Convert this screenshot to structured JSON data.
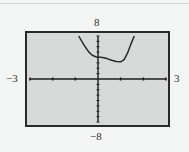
{
  "chart_data": {
    "type": "line",
    "title": "",
    "xlabel": "",
    "ylabel": "",
    "xlim": [
      -3,
      3
    ],
    "ylim": [
      -8,
      8
    ],
    "x_tick_step": 1,
    "y_tick_step": 1,
    "grid": false,
    "window_labels": {
      "ymax": "8",
      "ymin": "−8",
      "xmin": "−3",
      "xmax": "3"
    },
    "series": [
      {
        "name": "f(x)",
        "x": [
          -0.85,
          -0.7,
          -0.55,
          -0.4,
          -0.25,
          -0.1,
          0,
          0.2,
          0.4,
          0.6,
          0.8,
          1.0,
          1.15,
          1.3,
          1.45,
          1.6
        ],
        "y": [
          8,
          6.9,
          5.9,
          5.0,
          4.4,
          4.15,
          4.1,
          4.0,
          3.8,
          3.5,
          3.25,
          3.2,
          3.6,
          4.8,
          6.5,
          8
        ]
      }
    ]
  },
  "colors": {
    "screen_bg": "#d8dada",
    "frame": "#2a2a2a",
    "axis": "#1e1e1e",
    "curve": "#2b2b2b",
    "page_bg": "#f4f5f5"
  }
}
